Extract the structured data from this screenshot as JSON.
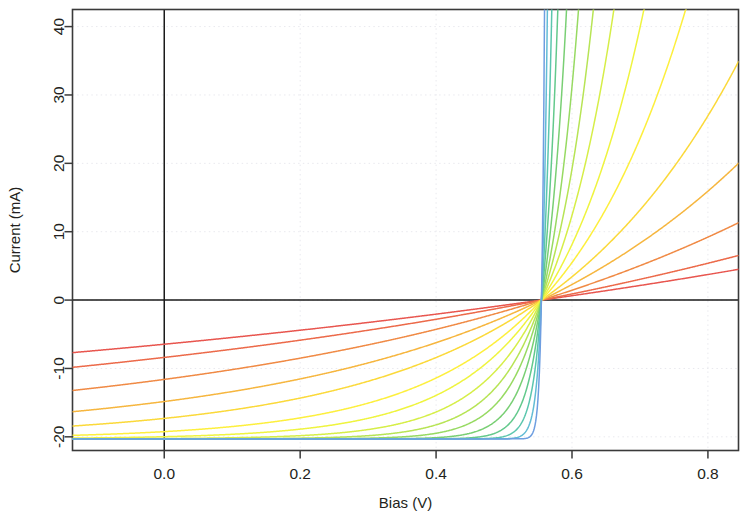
{
  "chart_data": {
    "type": "line",
    "title": "",
    "xlabel": "Bias (V)",
    "ylabel": "Current (mA)",
    "xlim": [
      -0.135,
      0.845
    ],
    "ylim": [
      -22.0,
      42.5
    ],
    "xticks": [
      0.0,
      0.2,
      0.4,
      0.6,
      0.8
    ],
    "xtick_labels": [
      "0.0",
      "0.2",
      "0.4",
      "0.6",
      "0.8"
    ],
    "yticks": [
      -20,
      -10,
      0,
      10,
      20,
      30,
      40
    ],
    "ytick_labels": [
      "-20",
      "-10",
      "0",
      "10",
      "20",
      "30",
      "40"
    ],
    "grid": "dotted, light gray, both axes",
    "legend": "none",
    "zero_line_y": 0,
    "zero_line_x": 0.0,
    "colormap": "rainbow (red -> orange -> yellow -> green -> blue)",
    "n_curves": 15,
    "series": [
      {
        "name": "curve-01",
        "color": "#e8564f",
        "series_resistance_rank": 1,
        "slope_mA_per_V": 14.0,
        "i_at_xmin": -9.5,
        "i_at_xmax": 4.7,
        "shape": "near-linear, resistance dominated"
      },
      {
        "name": "curve-02",
        "color": "#ec6a4a",
        "series_resistance_rank": 2,
        "slope_mA_per_V": 19.5,
        "i_at_xmin": -13.2,
        "i_at_xmax": 8.8,
        "shape": "near-linear, resistance dominated"
      },
      {
        "name": "curve-03",
        "color": "#f08a45",
        "series_resistance_rank": 3,
        "slope_mA_per_V": 31.0,
        "i_at_xmin": -19.8,
        "i_at_xmax": 12.8,
        "shape": "slightly curved knee below 0 V"
      },
      {
        "name": "curve-04",
        "color": "#f6b63f",
        "series_resistance_rank": 4,
        "slope_mA_per_V": 48.0,
        "i_at_xmin": -20.2,
        "i_at_xmax": 24.5,
        "shape": "knee near 0.15 V"
      },
      {
        "name": "curve-05",
        "color": "#fbd93a",
        "series_resistance_rank": 5,
        "slope_mA_per_V": 70.0,
        "i_at_xmin": -20.3,
        "i_at_xmax": 35.0,
        "shape": "knee near 0.28 V"
      },
      {
        "name": "curve-06",
        "color": "#fdef3d",
        "series_resistance_rank": 6,
        "slope_mA_per_V": 108.0,
        "i_at_xmin": -20.3,
        "i_at_xmax": 42.5,
        "shape": "knee near 0.36 V"
      },
      {
        "name": "curve-07",
        "color": "#eff43f",
        "series_resistance_rank": 7,
        "slope_mA_per_V": 152.0,
        "i_at_xmin": -20.3,
        "i_at_xmax": 42.5,
        "shape": "knee near 0.41 V"
      },
      {
        "name": "curve-08",
        "color": "#d6ee48",
        "series_resistance_rank": 8,
        "slope_mA_per_V": 215.0,
        "i_at_xmin": -20.3,
        "i_at_xmax": 42.5,
        "shape": "knee near 0.44 V"
      },
      {
        "name": "curve-09",
        "color": "#b7e455",
        "series_resistance_rank": 9,
        "slope_mA_per_V": 300.0,
        "i_at_xmin": -20.3,
        "i_at_xmax": 42.5,
        "shape": "knee near 0.465 V"
      },
      {
        "name": "curve-10",
        "color": "#97da62",
        "series_resistance_rank": 10,
        "slope_mA_per_V": 420.0,
        "i_at_xmin": -20.3,
        "i_at_xmax": 42.5,
        "shape": "knee near 0.485 V"
      },
      {
        "name": "curve-11",
        "color": "#79cf74",
        "series_resistance_rank": 11,
        "slope_mA_per_V": 620.0,
        "i_at_xmin": -20.3,
        "i_at_xmax": 42.5,
        "shape": "knee near 0.50 V"
      },
      {
        "name": "curve-12",
        "color": "#63c98c",
        "series_resistance_rank": 12,
        "slope_mA_per_V": 950.0,
        "i_at_xmin": -20.3,
        "i_at_xmax": 42.5,
        "shape": "knee near 0.515 V"
      },
      {
        "name": "curve-13",
        "color": "#5bc6ad",
        "series_resistance_rank": 13,
        "slope_mA_per_V": 1500.0,
        "i_at_xmin": -20.3,
        "i_at_xmax": 42.5,
        "shape": "knee near 0.527 V"
      },
      {
        "name": "curve-14",
        "color": "#62bcd4",
        "series_resistance_rank": 14,
        "slope_mA_per_V": 2600.0,
        "i_at_xmin": -20.3,
        "i_at_xmax": 42.5,
        "shape": "near-vertical turn-on at 0.538 V"
      },
      {
        "name": "curve-15",
        "color": "#6e9ee0",
        "series_resistance_rank": 15,
        "slope_mA_per_V": 5000.0,
        "i_at_xmin": -20.3,
        "i_at_xmax": 42.5,
        "shape": "near-vertical turn-on at 0.545 V"
      }
    ],
    "crossing_point": {
      "v": 0.555,
      "i": 0.0
    },
    "saturation_current_mA": -20.3
  },
  "colors": {
    "frame": "#3a3a3a",
    "grid": "#e9e9ee",
    "zero_line": "#1a1a1a",
    "text": "#231f20",
    "background": "#ffffff"
  }
}
